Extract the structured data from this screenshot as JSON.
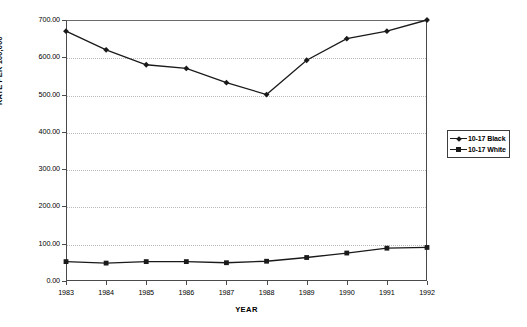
{
  "chart_data": {
    "type": "line",
    "title": "",
    "xlabel": "YEAR",
    "ylabel": "RATE PER 100,000",
    "categories": [
      "1983",
      "1984",
      "1985",
      "1986",
      "1987",
      "1988",
      "1989",
      "1990",
      "1991",
      "1992"
    ],
    "ylim": [
      0,
      700
    ],
    "ytick_labels": [
      "0.00",
      "100.00",
      "200.00",
      "300.00",
      "400.00",
      "500.00",
      "600.00",
      "700.00"
    ],
    "ytick_values": [
      0,
      100,
      200,
      300,
      400,
      500,
      600,
      700
    ],
    "grid": true,
    "grid_axis": "y",
    "legend_position": "right",
    "series": [
      {
        "name": "10-17 Black",
        "marker": "diamond",
        "color": "#1a1a1a",
        "values": [
          670,
          620,
          580,
          570,
          532,
          500,
          592,
          650,
          670,
          700
        ]
      },
      {
        "name": "10-17 White",
        "marker": "square",
        "color": "#1a1a1a",
        "values": [
          52,
          48,
          52,
          52,
          49,
          53,
          63,
          75,
          88,
          90
        ]
      }
    ]
  },
  "axes": {
    "x_title": "YEAR",
    "y_title": "RATE PER 100,000"
  },
  "legend": {
    "entries": [
      {
        "label": "10-17 Black"
      },
      {
        "label": "10-17 White"
      }
    ]
  }
}
